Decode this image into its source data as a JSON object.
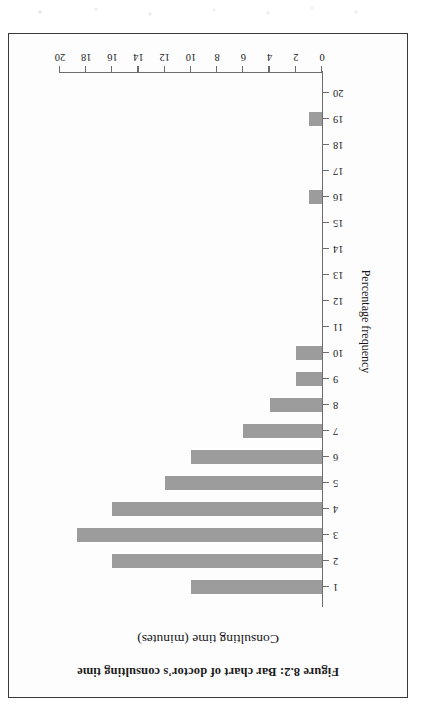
{
  "figure": {
    "caption": "Figure 8.2: Bar chart of doctor's consulting time",
    "bar_color": "#9c9c9c",
    "axis_color": "#6d6d6d",
    "frame_color": "#3b3b3b"
  },
  "chart_data": {
    "type": "bar",
    "orientation": "vertical-bars-rendered-rotated-180",
    "title": "",
    "xlabel": "Consulting time (minutes)",
    "ylabel": "Percentage frequency",
    "categories": [
      "1",
      "2",
      "3",
      "4",
      "5",
      "6",
      "7",
      "8",
      "9",
      "10",
      "11",
      "12",
      "13",
      "14",
      "15",
      "16",
      "17",
      "18",
      "19",
      "20"
    ],
    "values": [
      10,
      16,
      18.7,
      16,
      12,
      10,
      6,
      4,
      2,
      2,
      0,
      0,
      0,
      0,
      0,
      1,
      0,
      0,
      1,
      0
    ],
    "xlim": [
      0,
      20
    ],
    "ylim": [
      0,
      20
    ],
    "ytick_labels": [
      "0",
      "2",
      "4",
      "6",
      "8",
      "10",
      "12",
      "14",
      "16",
      "18",
      "20"
    ],
    "ytick_values": [
      0,
      2,
      4,
      6,
      8,
      10,
      12,
      14,
      16,
      18,
      20
    ],
    "xtick_labels": [
      "1",
      "2",
      "3",
      "4",
      "5",
      "6",
      "7",
      "8",
      "9",
      "10",
      "11",
      "12",
      "13",
      "14",
      "15",
      "16",
      "17",
      "18",
      "19",
      "20"
    ],
    "grid": false,
    "legend": null
  }
}
